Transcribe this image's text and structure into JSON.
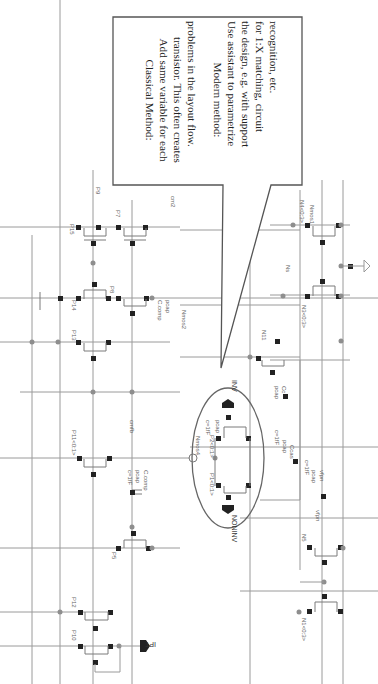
{
  "callout": {
    "classical_title": "Classical Method:",
    "classical_lines": [
      "Add same variable for each",
      "transistor. This often creates",
      "problems in the layout flow."
    ],
    "modern_title": "Modern method:",
    "modern_lines": [
      "Use assistant to parametrize",
      "the design, e.g. with support",
      "for 1:X matching, circuit",
      "recognition, etc."
    ]
  },
  "transistors": {
    "p15": "P15",
    "p7": "P7",
    "p9": "P9",
    "p14": "P14",
    "p8": "P8",
    "p13": "P13",
    "p11": "P11<0:1>",
    "p5": "P5",
    "p12": "P12",
    "p10": "P10",
    "p1": "P1<0:1>",
    "p2": "P2<0:1>",
    "n11": "N11",
    "n4": "N4<0:3>",
    "n3": "N3<0:3>",
    "n5": "N5",
    "n1": "N1<0:3>"
  },
  "nets": {
    "cm2": "cm2",
    "vbp": "vbp",
    "cmfb": "cmfb",
    "vfpn": "vfpn",
    "ns": "Ns",
    "nmos1": "Nmos1",
    "nmos2": "Nmos2",
    "nmos4": "Nmos4"
  },
  "caps": {
    "pcap": "pcap",
    "ccomp": "C.comp",
    "ccas": "Ccas",
    "cc": "Cc",
    "cval": "c=1fF"
  },
  "pins": {
    "inv": "INV",
    "noninv": "NONINV",
    "ipt": "IPT"
  }
}
